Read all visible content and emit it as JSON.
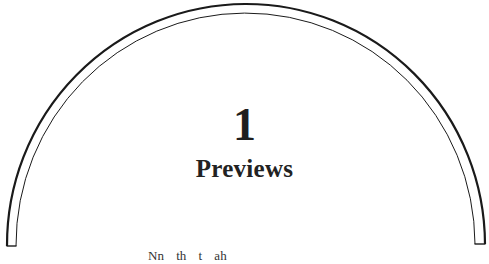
{
  "page": {
    "chapter_number": "1",
    "chapter_title": "Previews",
    "truncated_line": "Nn th t ah"
  },
  "ornament": {
    "type": "double-arch-border",
    "stroke_color": "#1a1a1a"
  }
}
